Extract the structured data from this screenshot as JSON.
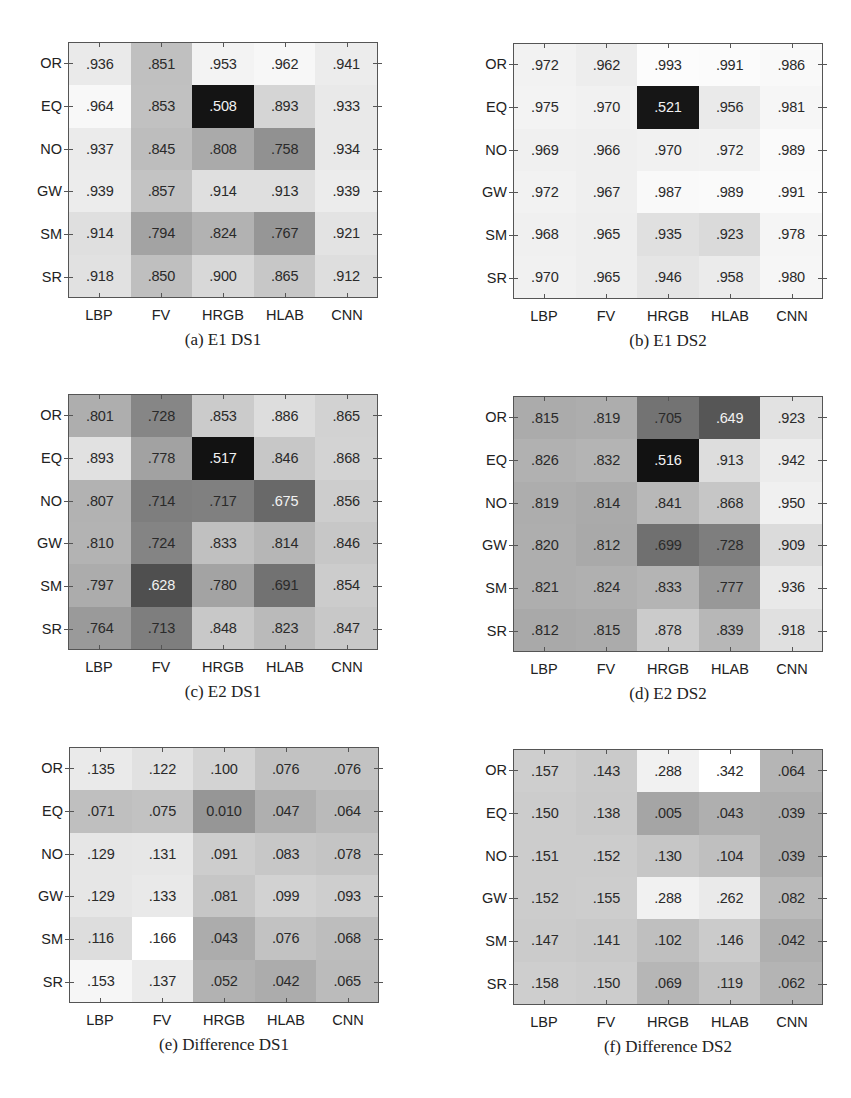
{
  "figure": {
    "row_labels": [
      "OR",
      "EQ",
      "NO",
      "GW",
      "SM",
      "SR"
    ],
    "col_labels": [
      "LBP",
      "FV",
      "HRGB",
      "HLAB",
      "CNN"
    ]
  },
  "chart_data": [
    {
      "type": "heatmap",
      "title": "(a) E1 DS1",
      "caption": "(a) E1 DS1",
      "x": [
        "LBP",
        "FV",
        "HRGB",
        "HLAB",
        "CNN"
      ],
      "y": [
        "OR",
        "EQ",
        "NO",
        "GW",
        "SM",
        "SR"
      ],
      "labels": [
        [
          ".936",
          ".851",
          ".953",
          ".962",
          ".941"
        ],
        [
          ".964",
          ".853",
          ".508",
          ".893",
          ".933"
        ],
        [
          ".937",
          ".845",
          ".808",
          ".758",
          ".934"
        ],
        [
          ".939",
          ".857",
          ".914",
          ".913",
          ".939"
        ],
        [
          ".914",
          ".794",
          ".824",
          ".767",
          ".921"
        ],
        [
          ".918",
          ".850",
          ".900",
          ".865",
          ".912"
        ]
      ],
      "values": [
        [
          0.936,
          0.851,
          0.953,
          0.962,
          0.941
        ],
        [
          0.964,
          0.853,
          0.508,
          0.893,
          0.933
        ],
        [
          0.937,
          0.845,
          0.808,
          0.758,
          0.934
        ],
        [
          0.939,
          0.857,
          0.914,
          0.913,
          0.939
        ],
        [
          0.914,
          0.794,
          0.824,
          0.767,
          0.921
        ],
        [
          0.918,
          0.85,
          0.9,
          0.865,
          0.912
        ]
      ],
      "colormap": "gray",
      "grid": false,
      "legend": false
    },
    {
      "type": "heatmap",
      "title": "(b) E1 DS2",
      "caption": "(b) E1 DS2",
      "x": [
        "LBP",
        "FV",
        "HRGB",
        "HLAB",
        "CNN"
      ],
      "y": [
        "OR",
        "EQ",
        "NO",
        "GW",
        "SM",
        "SR"
      ],
      "labels": [
        [
          ".972",
          ".962",
          ".993",
          ".991",
          ".986"
        ],
        [
          ".975",
          ".970",
          ".521",
          ".956",
          ".981"
        ],
        [
          ".969",
          ".966",
          ".970",
          ".972",
          ".989"
        ],
        [
          ".972",
          ".967",
          ".987",
          ".989",
          ".991"
        ],
        [
          ".968",
          ".965",
          ".935",
          ".923",
          ".978"
        ],
        [
          ".970",
          ".965",
          ".946",
          ".958",
          ".980"
        ]
      ],
      "values": [
        [
          0.972,
          0.962,
          0.993,
          0.991,
          0.986
        ],
        [
          0.975,
          0.97,
          0.521,
          0.956,
          0.981
        ],
        [
          0.969,
          0.966,
          0.97,
          0.972,
          0.989
        ],
        [
          0.972,
          0.967,
          0.987,
          0.989,
          0.991
        ],
        [
          0.968,
          0.965,
          0.935,
          0.923,
          0.978
        ],
        [
          0.97,
          0.965,
          0.946,
          0.958,
          0.98
        ]
      ],
      "colormap": "gray",
      "grid": false,
      "legend": false
    },
    {
      "type": "heatmap",
      "title": "(c) E2 DS1",
      "caption": "(c) E2 DS1",
      "x": [
        "LBP",
        "FV",
        "HRGB",
        "HLAB",
        "CNN"
      ],
      "y": [
        "OR",
        "EQ",
        "NO",
        "GW",
        "SM",
        "SR"
      ],
      "labels": [
        [
          ".801",
          ".728",
          ".853",
          ".886",
          ".865"
        ],
        [
          ".893",
          ".778",
          ".517",
          ".846",
          ".868"
        ],
        [
          ".807",
          ".714",
          ".717",
          ".675",
          ".856"
        ],
        [
          ".810",
          ".724",
          ".833",
          ".814",
          ".846"
        ],
        [
          ".797",
          ".628",
          ".780",
          ".691",
          ".854"
        ],
        [
          ".764",
          ".713",
          ".848",
          ".823",
          ".847"
        ]
      ],
      "values": [
        [
          0.801,
          0.728,
          0.853,
          0.886,
          0.865
        ],
        [
          0.893,
          0.778,
          0.517,
          0.846,
          0.868
        ],
        [
          0.807,
          0.714,
          0.717,
          0.675,
          0.856
        ],
        [
          0.81,
          0.724,
          0.833,
          0.814,
          0.846
        ],
        [
          0.797,
          0.628,
          0.78,
          0.691,
          0.854
        ],
        [
          0.764,
          0.713,
          0.848,
          0.823,
          0.847
        ]
      ],
      "colormap": "gray",
      "grid": false,
      "legend": false
    },
    {
      "type": "heatmap",
      "title": "(d) E2 DS2",
      "caption": "(d) E2 DS2",
      "x": [
        "LBP",
        "FV",
        "HRGB",
        "HLAB",
        "CNN"
      ],
      "y": [
        "OR",
        "EQ",
        "NO",
        "GW",
        "SM",
        "SR"
      ],
      "labels": [
        [
          ".815",
          ".819",
          ".705",
          ".649",
          ".923"
        ],
        [
          ".826",
          ".832",
          ".516",
          ".913",
          ".942"
        ],
        [
          ".819",
          ".814",
          ".841",
          ".868",
          ".950"
        ],
        [
          ".820",
          ".812",
          ".699",
          ".728",
          ".909"
        ],
        [
          ".821",
          ".824",
          ".833",
          ".777",
          ".936"
        ],
        [
          ".812",
          ".815",
          ".878",
          ".839",
          ".918"
        ]
      ],
      "values": [
        [
          0.815,
          0.819,
          0.705,
          0.649,
          0.923
        ],
        [
          0.826,
          0.832,
          0.516,
          0.913,
          0.942
        ],
        [
          0.819,
          0.814,
          0.841,
          0.868,
          0.95
        ],
        [
          0.82,
          0.812,
          0.699,
          0.728,
          0.909
        ],
        [
          0.821,
          0.824,
          0.833,
          0.777,
          0.936
        ],
        [
          0.812,
          0.815,
          0.878,
          0.839,
          0.918
        ]
      ],
      "colormap": "gray",
      "grid": false,
      "legend": false
    },
    {
      "type": "heatmap",
      "title": "(e) Difference DS1",
      "caption": "(e) Difference DS1",
      "x": [
        "LBP",
        "FV",
        "HRGB",
        "HLAB",
        "CNN"
      ],
      "y": [
        "OR",
        "EQ",
        "NO",
        "GW",
        "SM",
        "SR"
      ],
      "labels": [
        [
          ".135",
          ".122",
          ".100",
          ".076",
          ".076"
        ],
        [
          ".071",
          ".075",
          "0.010",
          ".047",
          ".064"
        ],
        [
          ".129",
          ".131",
          ".091",
          ".083",
          ".078"
        ],
        [
          ".129",
          ".133",
          ".081",
          ".099",
          ".093"
        ],
        [
          ".116",
          ".166",
          ".043",
          ".076",
          ".068"
        ],
        [
          ".153",
          ".137",
          ".052",
          ".042",
          ".065"
        ]
      ],
      "values": [
        [
          0.135,
          0.122,
          0.1,
          0.076,
          0.076
        ],
        [
          0.071,
          0.075,
          0.01,
          0.047,
          0.064
        ],
        [
          0.129,
          0.131,
          0.091,
          0.083,
          0.078
        ],
        [
          0.129,
          0.133,
          0.081,
          0.099,
          0.093
        ],
        [
          0.116,
          0.166,
          0.043,
          0.076,
          0.068
        ],
        [
          0.153,
          0.137,
          0.052,
          0.042,
          0.065
        ]
      ],
      "colormap": "gray",
      "grid": false,
      "legend": false
    },
    {
      "type": "heatmap",
      "title": "(f) Difference DS2",
      "caption": "(f) Difference DS2",
      "x": [
        "LBP",
        "FV",
        "HRGB",
        "HLAB",
        "CNN"
      ],
      "y": [
        "OR",
        "EQ",
        "NO",
        "GW",
        "SM",
        "SR"
      ],
      "labels": [
        [
          ".157",
          ".143",
          ".288",
          ".342",
          ".064"
        ],
        [
          ".150",
          ".138",
          ".005",
          ".043",
          ".039"
        ],
        [
          ".151",
          ".152",
          ".130",
          ".104",
          ".039"
        ],
        [
          ".152",
          ".155",
          ".288",
          ".262",
          ".082"
        ],
        [
          ".147",
          ".141",
          ".102",
          ".146",
          ".042"
        ],
        [
          ".158",
          ".150",
          ".069",
          ".119",
          ".062"
        ]
      ],
      "values": [
        [
          0.157,
          0.143,
          0.288,
          0.342,
          0.064
        ],
        [
          0.15,
          0.138,
          0.005,
          0.043,
          0.039
        ],
        [
          0.151,
          0.152,
          0.13,
          0.104,
          0.039
        ],
        [
          0.152,
          0.155,
          0.288,
          0.262,
          0.082
        ],
        [
          0.147,
          0.141,
          0.102,
          0.146,
          0.042
        ],
        [
          0.158,
          0.15,
          0.069,
          0.119,
          0.062
        ]
      ],
      "colormap": "gray",
      "grid": false,
      "legend": false
    }
  ],
  "layout": {
    "panels": [
      {
        "plot_left": 68,
        "plot_top": 42
      },
      {
        "plot_left": 513,
        "plot_top": 43
      },
      {
        "plot_left": 68,
        "plot_top": 394
      },
      {
        "plot_left": 513,
        "plot_top": 396
      },
      {
        "plot_left": 69,
        "plot_top": 747
      },
      {
        "plot_left": 513,
        "plot_top": 749
      }
    ],
    "shading": [
      {
        "min": 0.508,
        "max": 0.964,
        "dark": 20,
        "light": 248
      },
      {
        "min": 0.521,
        "max": 0.993,
        "dark": 22,
        "light": 252
      },
      {
        "min": 0.517,
        "max": 0.893,
        "dark": 18,
        "light": 225
      },
      {
        "min": 0.516,
        "max": 0.95,
        "dark": 18,
        "light": 240
      },
      {
        "min": 0.01,
        "max": 0.166,
        "dark": 150,
        "light": 255
      },
      {
        "min": 0.005,
        "max": 0.342,
        "dark": 165,
        "light": 255
      }
    ]
  }
}
